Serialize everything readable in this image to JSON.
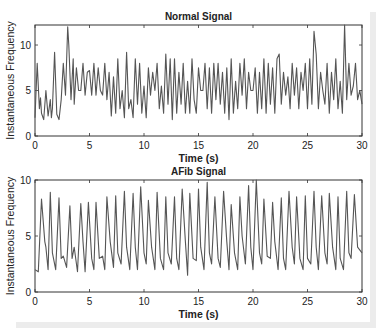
{
  "chart_data": [
    {
      "type": "line",
      "title": "Normal Signal",
      "xlabel": "Time (s)",
      "ylabel": "Instantaneous Frequency",
      "xlim": [
        0,
        30
      ],
      "ylim": [
        0,
        12.2
      ],
      "xticks": [
        0,
        5,
        10,
        15,
        20,
        25,
        30
      ],
      "yticks": [
        0,
        5,
        10
      ],
      "grid": false,
      "line_color": "#555555",
      "series": [
        {
          "name": "Normal",
          "x": [
            0,
            0.2,
            0.4,
            0.5,
            0.6,
            0.8,
            1.0,
            1.2,
            1.4,
            1.5,
            1.6,
            1.8,
            2.0,
            2.2,
            2.4,
            2.6,
            2.8,
            3.0,
            3.1,
            3.3,
            3.5,
            3.6,
            3.8,
            4.0,
            4.2,
            4.4,
            4.6,
            4.8,
            5.0,
            5.2,
            5.4,
            5.6,
            5.8,
            6.0,
            6.2,
            6.4,
            6.6,
            6.8,
            7.0,
            7.2,
            7.4,
            7.6,
            7.8,
            8.0,
            8.2,
            8.4,
            8.6,
            8.8,
            9.0,
            9.2,
            9.4,
            9.6,
            9.8,
            10.0,
            10.2,
            10.4,
            10.6,
            10.8,
            11.0,
            11.2,
            11.4,
            11.6,
            11.8,
            12.0,
            12.2,
            12.4,
            12.6,
            12.8,
            13.0,
            13.2,
            13.4,
            13.6,
            13.8,
            14.0,
            14.2,
            14.4,
            14.6,
            14.8,
            15.0,
            15.2,
            15.4,
            15.6,
            15.8,
            16.0,
            16.2,
            16.4,
            16.6,
            16.8,
            17.0,
            17.2,
            17.4,
            17.6,
            17.8,
            18.0,
            18.2,
            18.4,
            18.6,
            18.8,
            19.0,
            19.2,
            19.4,
            19.6,
            19.8,
            20.0,
            20.2,
            20.4,
            20.6,
            20.8,
            21.0,
            21.2,
            21.4,
            21.6,
            21.8,
            22.0,
            22.2,
            22.4,
            22.6,
            22.8,
            23.0,
            23.2,
            23.4,
            23.6,
            23.8,
            24.0,
            24.2,
            24.4,
            24.6,
            24.8,
            25.0,
            25.2,
            25.4,
            25.6,
            25.8,
            26.0,
            26.2,
            26.4,
            26.6,
            26.8,
            27.0,
            27.2,
            27.4,
            27.6,
            27.8,
            28.0,
            28.2,
            28.4,
            28.6,
            28.8,
            29.0,
            29.2,
            29.4,
            29.6,
            29.8,
            30.0
          ],
          "y": [
            2.0,
            8.0,
            3.0,
            4.2,
            2.5,
            1.8,
            5.0,
            2.2,
            4.0,
            2.0,
            3.0,
            9.2,
            2.4,
            1.8,
            4.0,
            8.0,
            4.5,
            12.0,
            10.0,
            4.0,
            8.5,
            3.5,
            7.5,
            5.0,
            5.0,
            8.0,
            4.5,
            7.0,
            7.2,
            4.5,
            8.0,
            4.5,
            7.5,
            5.0,
            4.5,
            8.0,
            4.0,
            7.0,
            2.2,
            6.5,
            2.5,
            8.5,
            3.0,
            5.0,
            2.0,
            9.2,
            3.0,
            4.0,
            2.0,
            8.5,
            3.5,
            8.0,
            2.5,
            5.5,
            2.0,
            7.5,
            4.5,
            7.0,
            5.0,
            8.0,
            3.0,
            5.5,
            2.5,
            9.0,
            3.5,
            8.5,
            1.8,
            8.5,
            2.5,
            7.0,
            3.5,
            8.0,
            2.5,
            6.0,
            2.5,
            8.5,
            4.0,
            2.5,
            7.5,
            5.0,
            5.0,
            8.0,
            3.0,
            7.5,
            2.5,
            8.0,
            4.0,
            8.0,
            3.5,
            7.0,
            2.5,
            7.5,
            1.8,
            8.5,
            2.5,
            6.0,
            3.0,
            8.0,
            4.5,
            8.5,
            3.0,
            7.0,
            5.0,
            5.0,
            7.5,
            2.5,
            7.0,
            3.0,
            8.5,
            2.5,
            8.0,
            3.5,
            7.5,
            2.5,
            8.5,
            9.0,
            3.5,
            7.0,
            4.5,
            6.5,
            3.0,
            8.0,
            4.5,
            7.5,
            3.0,
            7.0,
            5.0,
            8.0,
            3.0,
            8.5,
            3.5,
            11.5,
            9.0,
            3.0,
            7.0,
            5.0,
            3.5,
            8.0,
            2.5,
            7.0,
            4.0,
            8.5,
            3.0,
            6.0,
            2.5,
            12.2,
            4.0,
            8.0,
            4.5,
            5.5,
            8.0,
            4.0,
            5.0,
            3.5
          ]
        }
      ]
    },
    {
      "type": "line",
      "title": "AFib Signal",
      "xlabel": "Time (s)",
      "ylabel": "Instantaneous Frequency",
      "xlim": [
        0,
        30
      ],
      "ylim": [
        0,
        10
      ],
      "xticks": [
        0,
        5,
        10,
        15,
        20,
        25,
        30
      ],
      "yticks": [
        0,
        5,
        10
      ],
      "grid": false,
      "line_color": "#555555",
      "series": [
        {
          "name": "AFib",
          "x": [
            0,
            0.3,
            0.6,
            0.9,
            1.0,
            1.2,
            1.4,
            1.6,
            1.9,
            2.2,
            2.4,
            2.6,
            2.9,
            3.2,
            3.4,
            3.6,
            3.9,
            4.2,
            4.4,
            4.6,
            4.9,
            5.2,
            5.4,
            5.6,
            5.9,
            6.2,
            6.4,
            6.6,
            6.9,
            7.2,
            7.4,
            7.6,
            7.9,
            8.2,
            8.4,
            8.7,
            9.0,
            9.2,
            9.4,
            9.7,
            10.0,
            10.2,
            10.4,
            10.7,
            11.0,
            11.2,
            11.5,
            11.8,
            12.0,
            12.2,
            12.5,
            12.8,
            13.0,
            13.2,
            13.5,
            13.8,
            14.0,
            14.2,
            14.5,
            14.8,
            15.0,
            15.2,
            15.5,
            15.8,
            16.0,
            16.2,
            16.5,
            16.8,
            17.0,
            17.3,
            17.6,
            17.8,
            18.0,
            18.3,
            18.6,
            18.8,
            19.0,
            19.3,
            19.6,
            19.8,
            20.0,
            20.3,
            20.6,
            20.8,
            21.0,
            21.3,
            21.6,
            21.8,
            22.0,
            22.3,
            22.6,
            22.8,
            23.0,
            23.3,
            23.6,
            23.8,
            24.0,
            24.3,
            24.6,
            24.8,
            25.0,
            25.3,
            25.6,
            25.8,
            26.0,
            26.3,
            26.6,
            26.8,
            27.0,
            27.3,
            27.6,
            27.8,
            28.0,
            28.3,
            28.6,
            28.8,
            29.0,
            29.3,
            29.6,
            30.0
          ],
          "y": [
            2.0,
            1.8,
            8.3,
            4.5,
            4.0,
            2.0,
            8.9,
            3.5,
            2.0,
            8.4,
            3.0,
            3.2,
            2.2,
            7.7,
            3.0,
            4.0,
            1.8,
            7.9,
            4.5,
            1.8,
            8.0,
            3.0,
            2.0,
            8.0,
            3.0,
            3.2,
            2.0,
            8.5,
            4.5,
            2.2,
            8.6,
            3.5,
            2.5,
            9.0,
            4.0,
            2.0,
            8.8,
            4.0,
            2.0,
            9.4,
            3.5,
            2.5,
            8.2,
            4.0,
            2.0,
            8.9,
            3.0,
            2.0,
            8.5,
            3.5,
            2.5,
            8.5,
            3.0,
            2.0,
            9.2,
            4.5,
            1.5,
            8.8,
            3.0,
            2.8,
            9.2,
            4.0,
            2.0,
            9.8,
            3.5,
            2.5,
            8.5,
            3.0,
            2.2,
            9.0,
            4.5,
            2.0,
            7.8,
            3.5,
            2.0,
            8.5,
            5.0,
            2.5,
            9.5,
            4.0,
            2.0,
            10.0,
            3.5,
            2.5,
            8.3,
            3.2,
            3.0,
            8.0,
            4.5,
            2.0,
            8.4,
            3.0,
            2.0,
            9.0,
            4.0,
            2.5,
            8.5,
            3.0,
            2.0,
            8.6,
            3.0,
            2.5,
            9.0,
            4.0,
            2.0,
            8.6,
            3.5,
            2.5,
            8.8,
            4.0,
            2.0,
            8.5,
            3.0,
            2.0,
            9.0,
            3.5,
            3.0,
            8.7,
            4.0,
            3.5
          ]
        }
      ]
    }
  ]
}
